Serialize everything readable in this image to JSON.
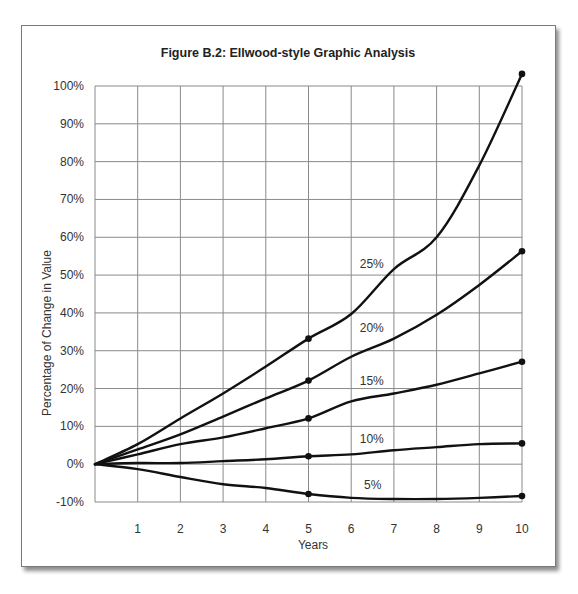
{
  "chart_data": {
    "type": "line",
    "title": "Figure B.2: Ellwood-style Graphic Analysis",
    "xlabel": "Years",
    "ylabel": "Percentage of  Change in Value",
    "x": [
      0,
      1,
      2,
      3,
      4,
      5,
      6,
      7,
      8,
      9,
      10
    ],
    "x_tick_labels": [
      "1",
      "2",
      "3",
      "4",
      "5",
      "6",
      "7",
      "8",
      "9",
      "10"
    ],
    "y_tick_labels": [
      "100%",
      "90%",
      "80%",
      "70%",
      "60%",
      "50%",
      "40%",
      "30%",
      "20%",
      "10%",
      "0%",
      "-10%"
    ],
    "xlim": [
      0,
      10
    ],
    "ylim": [
      -10,
      100
    ],
    "grid": true,
    "legend": "inline labels on curves",
    "series": [
      {
        "name": "25%",
        "values": [
          0,
          5.3,
          12.1,
          18.7,
          25.8,
          33.2,
          39.7,
          51.6,
          60.0,
          79.0,
          103.2
        ],
        "markers_at": [
          5,
          10
        ]
      },
      {
        "name": "20%",
        "values": [
          0,
          3.9,
          7.9,
          12.6,
          17.4,
          22.1,
          28.4,
          33.2,
          39.5,
          47.4,
          56.3
        ],
        "markers_at": [
          5,
          10
        ]
      },
      {
        "name": "15%",
        "values": [
          0,
          2.6,
          5.3,
          7.1,
          9.5,
          12.1,
          16.6,
          18.7,
          21.0,
          24.0,
          27.1
        ],
        "markers_at": [
          5,
          10
        ]
      },
      {
        "name": "10%",
        "values": [
          0,
          0.3,
          0.3,
          0.8,
          1.3,
          2.1,
          2.6,
          3.7,
          4.5,
          5.3,
          5.5
        ],
        "markers_at": [
          5,
          10
        ]
      },
      {
        "name": "5%",
        "values": [
          0,
          -1.3,
          -3.4,
          -5.3,
          -6.3,
          -7.9,
          -8.9,
          -9.2,
          -9.2,
          -8.9,
          -8.4
        ],
        "markers_at": [
          5,
          10
        ]
      }
    ],
    "series_label_positions": [
      {
        "name": "25%",
        "x": 6.2,
        "y": 52
      },
      {
        "name": "20%",
        "x": 6.2,
        "y": 35
      },
      {
        "name": "15%",
        "x": 6.2,
        "y": 21
      },
      {
        "name": "10%",
        "x": 6.2,
        "y": 5.5
      },
      {
        "name": "5%",
        "x": 6.3,
        "y": -6.5
      }
    ]
  }
}
